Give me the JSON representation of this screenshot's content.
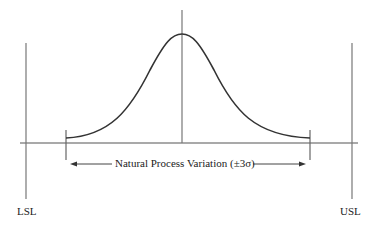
{
  "diagram": {
    "type": "process-capability",
    "labels": {
      "lsl": "LSL",
      "usl": "USL",
      "variation": "Natural Process Variation (±3σ)"
    },
    "colors": {
      "line": "#555555",
      "curve": "#333333",
      "text": "#222222"
    }
  }
}
